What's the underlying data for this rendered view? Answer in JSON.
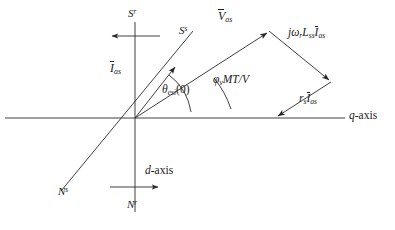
{
  "figure": {
    "type": "phasor-diagram",
    "title": "",
    "background": "#ffffff",
    "stroke_color": "#2a2a2a",
    "text_color": "#1b1b1b",
    "width": 395,
    "height": 230
  },
  "origin": {
    "x": 135,
    "y": 118
  },
  "axes": [
    {
      "id": "q-axis",
      "label": "q-axis",
      "label_plain": "q",
      "label_suffix": "-axis",
      "orientation": "horizontal",
      "from": {
        "x": 5,
        "y": 118
      },
      "to": {
        "x": 345,
        "y": 118
      },
      "label_pos": {
        "x": 347,
        "y": 110
      }
    },
    {
      "id": "d-axis",
      "label": "d-axis",
      "label_plain": "d",
      "label_suffix": "-axis",
      "orientation": "vertical",
      "from": {
        "x": 135,
        "y": 22
      },
      "to": {
        "x": 135,
        "y": 212
      },
      "label_pos": {
        "x": 144,
        "y": 166
      }
    },
    {
      "id": "stator-axis",
      "label": "",
      "orientation": "tilted",
      "from": {
        "x": 192,
        "y": 32
      },
      "to": {
        "x": 62,
        "y": 190
      }
    }
  ],
  "pole_labels": [
    {
      "id": "S-rotor",
      "base": "S",
      "sup": "r",
      "pos": {
        "x": 128,
        "y": 9
      }
    },
    {
      "id": "S-stator",
      "base": "S",
      "sup": "s",
      "pos": {
        "x": 179,
        "y": 26
      }
    },
    {
      "id": "N-stator",
      "base": "N",
      "sup": "s",
      "pos": {
        "x": 60,
        "y": 188
      }
    },
    {
      "id": "N-rotor",
      "base": "N",
      "sup": "r",
      "pos": {
        "x": 127,
        "y": 199
      }
    }
  ],
  "winding_arrows": [
    {
      "id": "rotor-winding-arrow",
      "description": "leftward arrow crossing the d-axis near the top",
      "from": {
        "x": 158,
        "y": 36
      },
      "to": {
        "x": 110,
        "y": 36
      }
    },
    {
      "id": "stator-winding-arrow",
      "description": "rightward arrow crossing the d-axis near the bottom",
      "from": {
        "x": 112,
        "y": 187
      },
      "to": {
        "x": 160,
        "y": 187
      }
    }
  ],
  "phasors": [
    {
      "id": "V-as",
      "label_base": "V",
      "label_sub": "as",
      "overbar": true,
      "from": {
        "x": 135,
        "y": 118
      },
      "to": {
        "x": 268,
        "y": 32
      },
      "label_pos": {
        "x": 219,
        "y": 11
      }
    },
    {
      "id": "I-as",
      "label_base": "I",
      "label_sub": "as",
      "overbar": true,
      "from": {
        "x": 135,
        "y": 118
      },
      "to": {
        "x": 176,
        "y": 66
      },
      "label_pos": {
        "x": 113,
        "y": 64
      }
    },
    {
      "id": "jwrLssIas",
      "label_parts": "jω_r L_ss Ī_as",
      "overbar": true,
      "from": {
        "x": 268,
        "y": 32
      },
      "to": {
        "x": 330,
        "y": 82
      },
      "label_pos": {
        "x": 290,
        "y": 28
      }
    },
    {
      "id": "rsIas",
      "label_parts": "r_s Ī_as",
      "overbar": true,
      "from": {
        "x": 330,
        "y": 82
      },
      "to": {
        "x": 276,
        "y": 117
      },
      "label_pos": {
        "x": 300,
        "y": 94
      }
    }
  ],
  "angles": [
    {
      "id": "theta-esi",
      "symbol": "θ",
      "sub": "esi",
      "arg": "(0)",
      "label_pos": {
        "x": 163,
        "y": 85
      },
      "arc_radius": 52,
      "from_deg": 0,
      "to_deg": 52
    },
    {
      "id": "phi-v",
      "symbol": "φ",
      "sub": "v",
      "suffix": "MT/V",
      "label_pos": {
        "x": 214,
        "y": 75
      },
      "arc_radius": 92,
      "from_deg": 0,
      "to_deg": 33
    }
  ],
  "angle_labels": {
    "theta_esi": {
      "symbol": "θ",
      "sub": "esi",
      "arg": "(0)"
    },
    "phi_v": {
      "symbol": "φ",
      "sub": "v",
      "suffix": "MT/V"
    }
  },
  "vector_labels": {
    "v_as": {
      "base": "V",
      "sub": "as"
    },
    "i_as": {
      "base": "I",
      "sub": "as"
    },
    "jw_term": {
      "j": "j",
      "omega": "ω",
      "omega_sub": "r",
      "L": "L",
      "L_sub": "ss",
      "I": "I",
      "I_sub": "as"
    },
    "rs_term": {
      "r": "r",
      "r_sub": "s",
      "I": "I",
      "I_sub": "as"
    }
  },
  "axis_labels": {
    "q": {
      "italic": "q",
      "rest": "-axis"
    },
    "d": {
      "italic": "d",
      "rest": "-axis"
    }
  },
  "poles": {
    "s_rotor": {
      "base": "S",
      "sup": "r"
    },
    "s_stator": {
      "base": "S",
      "sup": "s"
    },
    "n_stator": {
      "base": "N",
      "sup": "s"
    },
    "n_rotor": {
      "base": "N",
      "sup": "r"
    }
  }
}
